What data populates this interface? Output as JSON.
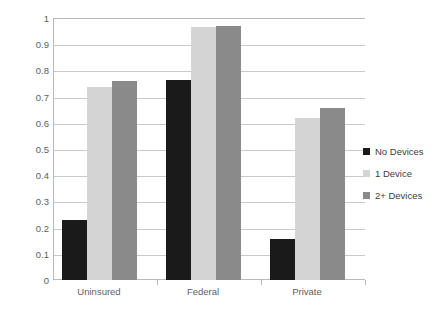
{
  "chart_data": {
    "type": "bar",
    "title": "",
    "subtitle": "",
    "xlabel": "",
    "ylabel": "",
    "categories": [
      "Uninsured",
      "Federal",
      "Private"
    ],
    "series": [
      {
        "name": "No Devices",
        "color": "#1a1a1a",
        "values": [
          0.23,
          0.765,
          0.155
        ]
      },
      {
        "name": "1 Device",
        "color": "#d4d4d4",
        "values": [
          0.735,
          0.965,
          0.62
        ]
      },
      {
        "name": "2+ Devices",
        "color": "#8a8a8a",
        "values": [
          0.76,
          0.97,
          0.655
        ]
      }
    ],
    "ylim": [
      0,
      1
    ],
    "ytick_labels": [
      "1",
      "0.9",
      "0.8",
      "0.7",
      "0.6",
      "0.5",
      "0.4",
      "0.3",
      "0.2",
      "0.1",
      "0"
    ],
    "ytick_values": [
      1,
      0.9,
      0.8,
      0.7,
      0.6,
      0.5,
      0.4,
      0.3,
      0.2,
      0.1,
      0
    ],
    "grid": true,
    "legend_position": "right",
    "axis_color": "#b9b9b9",
    "gridline_color": "#c9c9c9",
    "background": "#ffffff"
  }
}
